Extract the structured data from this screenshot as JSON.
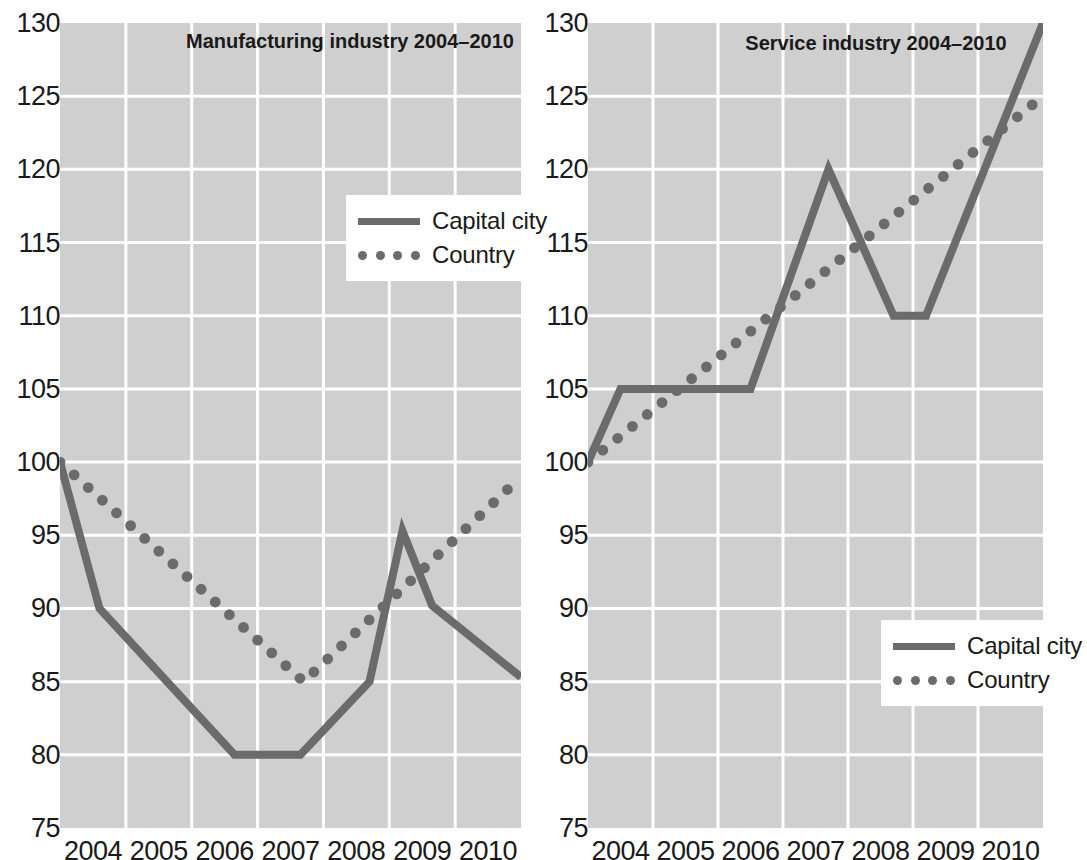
{
  "figure": {
    "background_color": "#ffffff",
    "plot_background_color": "#cfcfcf",
    "gridline_color": "#ffffff",
    "series_color": "#6b6b6b",
    "text_color": "#1a1a1a"
  },
  "legend": {
    "capital_city_label": "Capital city",
    "country_label": "Country",
    "position_left_panel": "upper-right-inside",
    "position_right_panel": "lower-right-inside"
  },
  "chart_data": [
    {
      "id": "manufacturing",
      "type": "line",
      "title": "Manufacturing industry 2004–2010",
      "xlabel": "",
      "ylabel": "",
      "ylim": [
        75,
        130
      ],
      "ytick_labels": [
        "130",
        "125",
        "120",
        "115",
        "110",
        "105",
        "100",
        "95",
        "90",
        "85",
        "80",
        "75"
      ],
      "ytick_values": [
        130,
        125,
        120,
        115,
        110,
        105,
        100,
        95,
        90,
        85,
        80,
        75
      ],
      "xtick_labels": [
        "2004",
        "2005",
        "2006",
        "2007",
        "2008",
        "2009",
        "2010"
      ],
      "xlim": [
        2003.75,
        2010.75
      ],
      "grid": true,
      "legend_entries": [
        "Capital city",
        "Country"
      ],
      "series": [
        {
          "name": "Capital city",
          "style": "solid",
          "color": "#6b6b6b",
          "x": [
            2003.75,
            2004.35,
            2006.4,
            2007.4,
            2008.45,
            2008.95,
            2009.4,
            2010.75
          ],
          "values": [
            100.0,
            90.0,
            80.0,
            80.0,
            85.0,
            95.3,
            90.2,
            85.3
          ]
        },
        {
          "name": "Country",
          "style": "dotted",
          "color": "#6b6b6b",
          "x": [
            2003.75,
            2007.45,
            2010.75
          ],
          "values": [
            100.0,
            85.0,
            99.0
          ]
        }
      ]
    },
    {
      "id": "service",
      "type": "line",
      "title": "Service industry 2004–2010",
      "xlabel": "",
      "ylabel": "",
      "ylim": [
        75,
        130
      ],
      "ytick_labels": [
        "130",
        "125",
        "120",
        "115",
        "110",
        "105",
        "100",
        "95",
        "90",
        "85",
        "80",
        "75"
      ],
      "ytick_values": [
        130,
        125,
        120,
        115,
        110,
        105,
        100,
        95,
        90,
        85,
        80,
        75
      ],
      "xtick_labels": [
        "2004",
        "2005",
        "2006",
        "2007",
        "2008",
        "2009",
        "2010"
      ],
      "xlim": [
        2003.75,
        2010.75
      ],
      "grid": true,
      "legend_entries": [
        "Capital city",
        "Country"
      ],
      "series": [
        {
          "name": "Capital city",
          "style": "solid",
          "color": "#6b6b6b",
          "x": [
            2003.75,
            2004.25,
            2006.25,
            2007.45,
            2008.45,
            2008.95,
            2010.75
          ],
          "values": [
            100.0,
            105.0,
            105.0,
            120.0,
            110.0,
            110.0,
            130.0
          ]
        },
        {
          "name": "Country",
          "style": "dotted",
          "color": "#6b6b6b",
          "x": [
            2003.75,
            2010.75
          ],
          "values": [
            100.0,
            125.0
          ]
        }
      ]
    }
  ]
}
